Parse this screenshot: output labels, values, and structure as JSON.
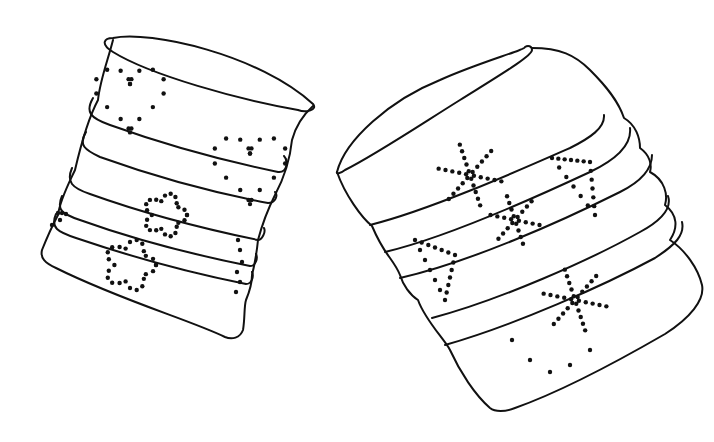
{
  "scene": {
    "title": "Two punched tin can lanterns line drawing",
    "background": "#ffffff",
    "ink_color": "#111111"
  },
  "objects": [
    {
      "name": "left-tin-can",
      "description": "Ribbed tin can tilted left with dotted heart and flower punch patterns",
      "patterns": [
        "heart",
        "heart",
        "flower",
        "flower"
      ]
    },
    {
      "name": "right-tin-can",
      "description": "Ribbed tin can tilted right with dotted star and triangle punch patterns",
      "patterns": [
        "star",
        "star",
        "triangle",
        "triangle",
        "star"
      ]
    }
  ]
}
